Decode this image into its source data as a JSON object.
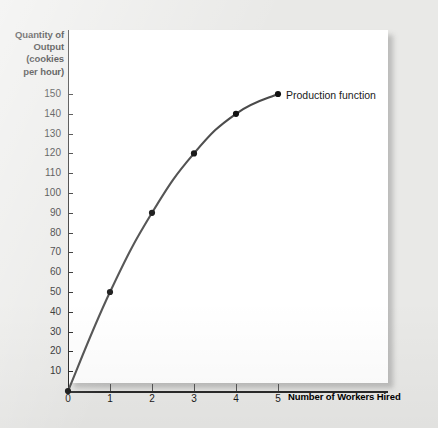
{
  "figure": {
    "background_color": "#e9e9e7",
    "panel_color": "#ffffff",
    "line_color": "#4a4a4a",
    "marker_color": "#111111",
    "axis_color": "#1a1a1a"
  },
  "chart_data": {
    "type": "line",
    "title": "",
    "xlabel": "Number of Workers Hired",
    "ylabel": "Quantity of Output (cookies per hour)",
    "ylabel_lines": [
      "Quantity of",
      "Output",
      "(cookies",
      "per hour)"
    ],
    "x": [
      0,
      1,
      2,
      3,
      4,
      5
    ],
    "values": [
      0,
      50,
      90,
      120,
      140,
      150
    ],
    "series": [
      {
        "name": "Production function",
        "x": [
          0,
          1,
          2,
          3,
          4,
          5
        ],
        "values": [
          0,
          50,
          90,
          120,
          140,
          150
        ]
      }
    ],
    "xlim": [
      0,
      5.6
    ],
    "ylim": [
      0,
      155
    ],
    "xticks": [
      0,
      1,
      2,
      3,
      4,
      5
    ],
    "xtick_labels": [
      "0",
      "1",
      "2",
      "3",
      "4",
      "5"
    ],
    "yticks": [
      10,
      20,
      30,
      40,
      50,
      60,
      70,
      80,
      90,
      100,
      110,
      120,
      130,
      140,
      150
    ],
    "ytick_labels": [
      "10",
      "20",
      "30",
      "40",
      "50",
      "60",
      "70",
      "80",
      "90",
      "100",
      "110",
      "120",
      "130",
      "140",
      "150"
    ],
    "grid": false,
    "legend_position": "inline-annotation",
    "annotations": [
      {
        "text": "Production function",
        "at_x": 5,
        "at_y": 150
      }
    ]
  }
}
